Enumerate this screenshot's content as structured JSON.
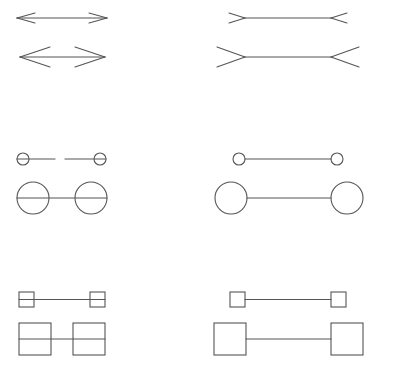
{
  "figure": {
    "stroke_color": "#555555",
    "background": "#ffffff",
    "rows": [
      {
        "name": "arrows",
        "items": [
          {
            "id": "arrow-inward-small",
            "type": "arrows-in",
            "y": 18,
            "x1": 17,
            "x2": 107,
            "head_len": 18,
            "head_half": 5
          },
          {
            "id": "arrow-inward-large",
            "type": "arrows-in",
            "y": 57,
            "x1": 20,
            "x2": 105,
            "head_len": 30,
            "head_half": 10
          },
          {
            "id": "fins-outward-small",
            "type": "fins-out",
            "y": 18,
            "x1": 245,
            "x2": 331,
            "fin_len": 16,
            "fin_half": 5
          },
          {
            "id": "fins-outward-large",
            "type": "fins-out",
            "y": 57,
            "x1": 245,
            "x2": 331,
            "fin_len": 28,
            "fin_half": 10
          }
        ]
      },
      {
        "name": "circles",
        "items": [
          {
            "id": "circles-small-inner",
            "type": "circles",
            "y": 159,
            "cx1": 23,
            "cx2": 100,
            "r": 6,
            "midline": true,
            "gap": [
              55,
              65
            ]
          },
          {
            "id": "circles-large-inner",
            "type": "circles",
            "y": 198,
            "cx1": 33,
            "cx2": 91,
            "r": 16,
            "midline": true
          },
          {
            "id": "circles-small-outer",
            "type": "circles",
            "y": 159,
            "cx1": 239,
            "cx2": 337,
            "r": 6,
            "midline": false
          },
          {
            "id": "circles-large-outer",
            "type": "circles",
            "y": 198,
            "cx1": 231,
            "cx2": 347,
            "r": 16,
            "midline": false
          }
        ]
      },
      {
        "name": "squares",
        "items": [
          {
            "id": "squares-small-inner",
            "type": "squares",
            "y": 299.5,
            "x1": 19,
            "x2": 90,
            "size": 15,
            "midline": true
          },
          {
            "id": "squares-large-inner",
            "type": "squares",
            "y": 339,
            "x1": 19,
            "x2": 73,
            "size": 32,
            "midline": true
          },
          {
            "id": "squares-small-outer",
            "type": "squares",
            "y": 299.5,
            "x1": 230,
            "x2": 331,
            "size": 15,
            "midline": false
          },
          {
            "id": "squares-large-outer",
            "type": "squares",
            "y": 339,
            "x1": 214,
            "x2": 331,
            "size": 32,
            "midline": false
          }
        ]
      }
    ]
  }
}
